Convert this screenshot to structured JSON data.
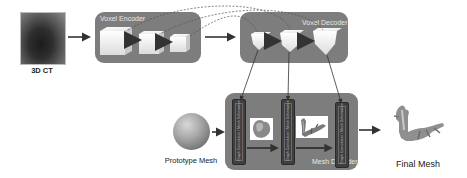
{
  "diagram": {
    "input": {
      "label": "3D CT",
      "icon": "ct-scan-image"
    },
    "voxel_encoder": {
      "title": "Voxel Encoder",
      "cube_count": 3
    },
    "voxel_decoder": {
      "title": "Voxel Decoder",
      "cube_count": 3
    },
    "mesh_decoder": {
      "title": "Mesh Decoder",
      "blocks": [
        {
          "text": "Graph Convolution / Mesh Deformation"
        },
        {
          "text": "Graph Convolution / Mesh Deformation"
        },
        {
          "text": "Graph Convolution / Mesh Deformation"
        }
      ],
      "intermediate_meshes": [
        "heart-mesh-coarse",
        "heart-mesh-refined"
      ]
    },
    "prototype": {
      "label": "Prototype Mesh",
      "icon": "sphere-mesh"
    },
    "output": {
      "label": "Final Mesh",
      "icon": "heart-final-mesh"
    },
    "colors": {
      "panel": "#7d7d7d",
      "block": "#3f3f3f",
      "arrow": "#333333",
      "cube_face": "#f2f2f2"
    }
  }
}
